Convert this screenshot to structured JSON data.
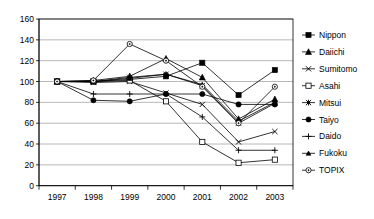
{
  "chart_data": {
    "type": "line",
    "title": "",
    "subtitle": "",
    "xlabel": "",
    "ylabel": "",
    "categories": [
      "1997",
      "1998",
      "1999",
      "2000",
      "2001",
      "2002",
      "2003"
    ],
    "ylim": [
      0,
      160
    ],
    "yticks": [
      0,
      20,
      40,
      60,
      80,
      100,
      120,
      140,
      160
    ],
    "ytick_labels": [
      "0",
      "20",
      "40",
      "60",
      "80",
      "100",
      "120",
      "140",
      "160"
    ],
    "grid": "horizontal",
    "legend_position": "right",
    "line_color": "#000000",
    "grid_color": "#999999",
    "axis_color": "#000000",
    "background": "#ffffff",
    "series": [
      {
        "name": "Nippon",
        "marker": "square-filled",
        "values": [
          100,
          100,
          102,
          105,
          118,
          87,
          111
        ]
      },
      {
        "name": "Daiichi",
        "marker": "triangle-filled",
        "values": [
          100,
          101,
          105,
          122,
          104,
          64,
          83
        ]
      },
      {
        "name": "Sumitomo",
        "marker": "x-cross",
        "values": [
          100,
          99,
          100,
          89,
          78,
          42,
          52
        ]
      },
      {
        "name": "Asahi",
        "marker": "square-open",
        "values": [
          100,
          100,
          101,
          81,
          42,
          22,
          25
        ]
      },
      {
        "name": "Mitsui",
        "marker": "star-asterisk",
        "values": [
          100,
          100,
          104,
          107,
          96,
          60,
          79
        ]
      },
      {
        "name": "Taiyo",
        "marker": "circle-filled",
        "values": [
          100,
          82,
          81,
          88,
          88,
          78,
          78
        ]
      },
      {
        "name": "Daido",
        "marker": "plus-cross",
        "values": [
          100,
          88,
          88,
          88,
          66,
          34,
          34
        ]
      },
      {
        "name": "Fukoku",
        "marker": "triangle-small",
        "values": [
          100,
          100,
          103,
          107,
          97,
          62,
          80
        ]
      },
      {
        "name": "TOPIX",
        "marker": "circle-open",
        "values": [
          100,
          101,
          136,
          120,
          95,
          60,
          95
        ]
      }
    ]
  },
  "legend": {
    "items": [
      {
        "label": "Nippon"
      },
      {
        "label": "Daiichi"
      },
      {
        "label": "Sumitomo"
      },
      {
        "label": "Asahi"
      },
      {
        "label": "Mitsui"
      },
      {
        "label": "Taiyo"
      },
      {
        "label": "Daido"
      },
      {
        "label": "Fukoku"
      },
      {
        "label": "TOPIX"
      }
    ]
  }
}
